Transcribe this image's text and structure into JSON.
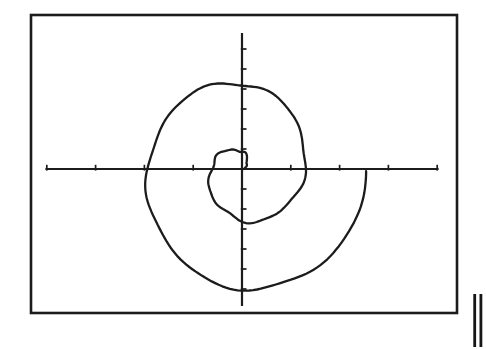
{
  "canvas": {
    "width": 486,
    "height": 349,
    "background": "#ffffff"
  },
  "figure": {
    "ink_color": "#1c1c1c"
  },
  "chart_data": {
    "type": "line",
    "plot_style": "polar-spiral",
    "equation": "r = a*theta",
    "direction": "counterclockwise",
    "turns": 2,
    "theta_start": 0,
    "theta_end": 12.55,
    "theta_step": 0.035,
    "px_per_radian": {
      "x": 10.0,
      "y": 10.9
    },
    "origin_px": {
      "x": 242,
      "y": 169
    },
    "wobble_terms": [
      [
        1.4,
        5.3,
        0.7
      ],
      [
        0.9,
        9.1,
        2.1
      ]
    ],
    "curve_stroke_width": 2.3,
    "frame": {
      "x": 31,
      "y": 15,
      "width": 426,
      "height": 298,
      "stroke_width": 2.6
    },
    "x_axis": {
      "x1": 46.5,
      "x2": 437.5,
      "tick_spacing": 48.8,
      "ticks_per_side": 4,
      "stroke_width": 2.2,
      "tick_up": 4.2,
      "tick_down": 1.6,
      "tick_stroke_width": 1.7
    },
    "y_axis": {
      "y1": 34,
      "y2": 305,
      "tick_spacing": 20,
      "ticks_per_side": 6,
      "stroke_width": 2.2,
      "tick_right": 4.5,
      "tick_left": 1.2,
      "tick_stroke_width": 1.7
    },
    "axis_crossings_px": {
      "negative_x": [
        209,
        150
      ],
      "positive_x": [
        303,
        363
      ],
      "top_y": [
        152,
        81
      ],
      "bottom_y": [
        218,
        287
      ]
    },
    "title": "",
    "xlabel": "",
    "ylabel": "",
    "grid": false,
    "legend": null
  },
  "margin_mark": {
    "label": "double-vertical-bar",
    "color": "#161616",
    "bars": [
      {
        "x": 473.3,
        "y": 294,
        "width": 2.8,
        "height": 53
      },
      {
        "x": 479.5,
        "y": 294,
        "width": 2.8,
        "height": 53
      }
    ]
  }
}
